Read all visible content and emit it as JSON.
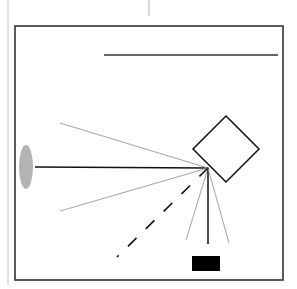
{
  "diagram": {
    "type": "optical-ray-diagram",
    "colors": {
      "background": "#ffffff",
      "frame": "#333333",
      "margin_line": "#cccccc",
      "ray_primary": "#111111",
      "ray_secondary": "#999999",
      "source": "#b3b3b3",
      "detector": "#000000"
    },
    "margin_line": {
      "x": 8,
      "y1": 0,
      "y2": 285
    },
    "top_tick": {
      "x": 149,
      "y1": 0,
      "y2": 16
    },
    "frame": {
      "x": 15,
      "y": 26,
      "width": 268,
      "height": 254
    },
    "top_bar": {
      "x1": 104,
      "y1": 55,
      "x2": 278,
      "y2": 55
    },
    "source": {
      "shape": "ellipse",
      "cx": 26,
      "cy": 167,
      "rx": 7,
      "ry": 22
    },
    "reflector": {
      "shape": "diamond",
      "cx": 226,
      "cy": 149,
      "half_diagonal": 33
    },
    "detector": {
      "shape": "rect",
      "x": 192,
      "y": 256,
      "width": 28,
      "height": 15
    },
    "focal_point": {
      "x": 208,
      "y": 168
    },
    "rays": [
      {
        "name": "incident-beam",
        "x2": 35,
        "y2": 167,
        "style": "solid",
        "weight": "primary"
      },
      {
        "name": "upper-scatter-ray",
        "x2": 60,
        "y2": 123,
        "style": "solid",
        "weight": "secondary"
      },
      {
        "name": "lower-scatter-ray",
        "x2": 60,
        "y2": 211,
        "style": "solid",
        "weight": "secondary"
      },
      {
        "name": "dashed-ray",
        "x2": 117,
        "y2": 257,
        "style": "dashed",
        "weight": "primary"
      },
      {
        "name": "left-cone-ray",
        "x2": 186,
        "y2": 240,
        "style": "solid",
        "weight": "secondary"
      },
      {
        "name": "center-ray-to-detector",
        "x2": 208,
        "y2": 244,
        "style": "solid",
        "weight": "primary"
      },
      {
        "name": "right-cone-ray",
        "x2": 229,
        "y2": 243,
        "style": "solid",
        "weight": "secondary"
      }
    ]
  }
}
